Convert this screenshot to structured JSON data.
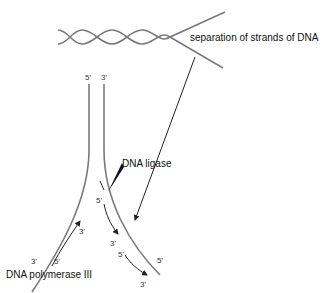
{
  "diagram": {
    "title_clipped": "",
    "labels": {
      "separation": "separation of strands of DNA",
      "ligase": "DNA ligase",
      "polymerase": "DNA polymerase III"
    },
    "primes": {
      "top_left": "5'",
      "top_right": "3'",
      "ligase_5": "5'",
      "lagging_3a": "3'",
      "lagging_5b": "5'",
      "lagging_3b": "3'",
      "right_strand_5": "5'",
      "leading_3_tip": "3'",
      "leading_3_bottom": "3'",
      "leading_5_bottom": "5'"
    },
    "colors": {
      "strand": "#7a7a7a",
      "arrow": "#222222",
      "text": "#111111"
    }
  }
}
